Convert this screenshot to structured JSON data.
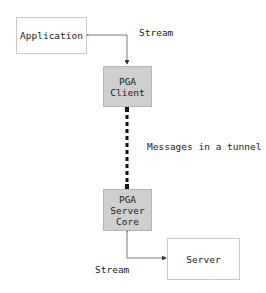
{
  "diagram": {
    "nodes": [
      {
        "id": "application",
        "label": "Application"
      },
      {
        "id": "pga_client",
        "label": "PGA\nClient"
      },
      {
        "id": "pga_server_core",
        "label": "PGA\nServer\nCore"
      },
      {
        "id": "server",
        "label": "Server"
      }
    ],
    "edges": [
      {
        "from": "application",
        "to": "pga_client",
        "label": "Stream",
        "style": "thin-bidirectional"
      },
      {
        "from": "pga_client",
        "to": "pga_server_core",
        "label": "Messages in a tunnel",
        "style": "thick-dashed"
      },
      {
        "from": "pga_server_core",
        "to": "server",
        "label": "Stream",
        "style": "thin-bidirectional"
      }
    ],
    "colors": {
      "node_fill_pga": "#cfcfcf",
      "node_fill_plain": "#ffffff",
      "line": "#333333"
    }
  }
}
